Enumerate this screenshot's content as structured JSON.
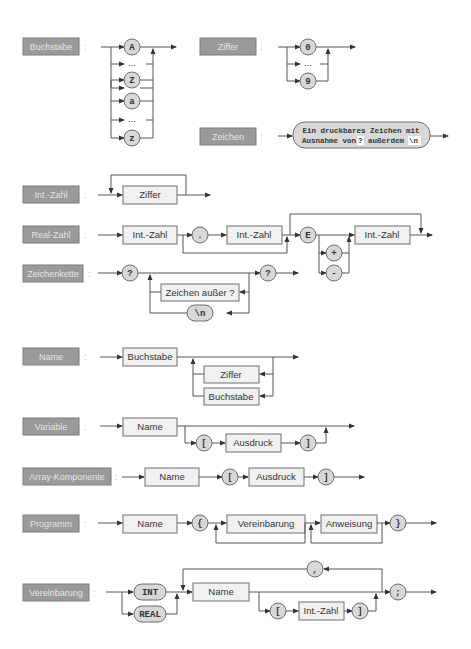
{
  "rules": {
    "buchstabe": {
      "name": "Buchstabe",
      "colon": ":",
      "terminals": [
        "A",
        "...",
        "Z",
        "a",
        "...",
        "z"
      ]
    },
    "ziffer": {
      "name": "Ziffer",
      "colon": ":",
      "terminals": [
        "0",
        "...",
        "9"
      ]
    },
    "zeichen": {
      "name": "Zeichen",
      "colon": ":",
      "line1": "Ein druckbares Zeichen mit",
      "line2_a": "Ausnahme von",
      "line2_q": "?",
      "line2_b": "außerdem",
      "line2_n": "\\n"
    },
    "int_zahl": {
      "name": "Int.-Zahl",
      "colon": ":",
      "box": "Ziffer"
    },
    "real_zahl": {
      "name": "Real-Zahl",
      "colon": ":",
      "box1": "Int.-Zahl",
      "dot": ".",
      "box2": "Int.-Zahl",
      "e": "E",
      "plus": "+",
      "minus": "-",
      "box3": "Int.-Zahl"
    },
    "zeichenkette": {
      "name": "Zeichenkette",
      "colon": ":",
      "q1": "?",
      "box": "Zeichen außer ?",
      "nl": "\\n",
      "q2": "?"
    },
    "name": {
      "name": "Name",
      "colon": ":",
      "box1": "Buchstabe",
      "box2": "Ziffer",
      "box3": "Buchstabe"
    },
    "variable": {
      "name": "Variable",
      "colon": ":",
      "box1": "Name",
      "lb": "[",
      "box2": "Ausdruck",
      "rb": "]"
    },
    "array": {
      "name": "Array-Komponente",
      "colon": ":",
      "box1": "Name",
      "lb": "[",
      "box2": "Ausdruck",
      "rb": "]"
    },
    "programm": {
      "name": "Programm",
      "colon": ":",
      "box1": "Name",
      "lc": "{",
      "box2": "Vereinbarung",
      "box3": "Anweisung",
      "rc": "}"
    },
    "vereinbarung": {
      "name": "Vereinbarung",
      "colon": ":",
      "int": "INT",
      "real": "REAL",
      "box1": "Name",
      "comma": ",",
      "lb": "[",
      "box2": "Int.-Zahl",
      "rb": "]",
      "semi": ";"
    }
  },
  "colors": {
    "label_bg": "#9a9a9a",
    "label_text": "#e6e6e6",
    "box_bg": "#f1f1f1",
    "terminal_bg": "#d8d8d8",
    "line": "#555555"
  }
}
